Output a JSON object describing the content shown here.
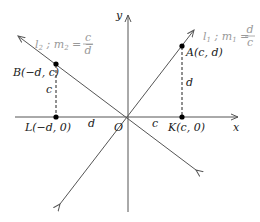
{
  "diagram": {
    "type": "coordinate-geometry",
    "axes": {
      "x_label": "x",
      "y_label": "y",
      "origin_label": "O"
    },
    "lines": [
      {
        "id": "l1",
        "name": "l",
        "sub": "1",
        "slope_name": "m",
        "slope_sub": "1",
        "slope_num": "d",
        "slope_den": "c",
        "slope_sign": ""
      },
      {
        "id": "l2",
        "name": "l",
        "sub": "2",
        "slope_name": "m",
        "slope_sub": "2",
        "slope_num": "c",
        "slope_den": "d",
        "slope_sign": "−"
      }
    ],
    "points": [
      {
        "id": "A",
        "label": "A(c, d)"
      },
      {
        "id": "B",
        "label": "B(−d, c)"
      },
      {
        "id": "K",
        "label": "K(c, 0)"
      },
      {
        "id": "L",
        "label": "L(−d, 0)"
      }
    ],
    "segment_labels": {
      "AK": "d",
      "BL": "c",
      "OK": "c",
      "LO": "d"
    },
    "colors": {
      "axis": "#555555",
      "line": "#555555",
      "label_gray": "#9a9a9a",
      "point": "#000000"
    }
  }
}
